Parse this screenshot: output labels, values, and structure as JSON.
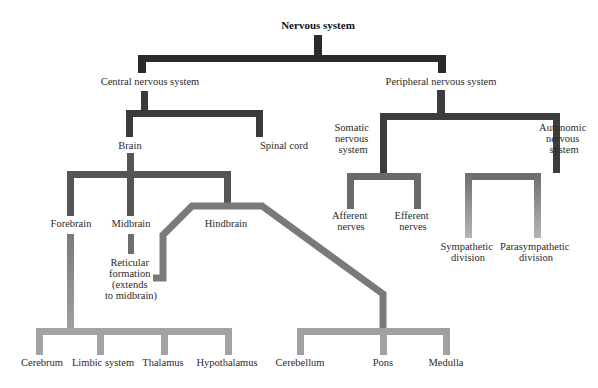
{
  "title": "Nervous system",
  "colors": {
    "level1": "#2b2b2b",
    "level2": "#3e3e3e",
    "level3": "#555555",
    "level4": "#6a6a6a",
    "level5": "#8a8a8a",
    "level6": "#a3a3a3",
    "background": "#ffffff"
  },
  "nodes": {
    "root": "Nervous system",
    "cns": "Central nervous system",
    "pns": "Peripheral nervous system",
    "brain": "Brain",
    "spinal_cord": "Spinal cord",
    "somatic": [
      "Somatic",
      "nervous",
      "system"
    ],
    "autonomic": [
      "Autonomic",
      "nervous",
      "system"
    ],
    "forebrain": "Forebrain",
    "midbrain": "Midbrain",
    "hindbrain": "Hindbrain",
    "reticular": [
      "Reticular",
      "formation",
      "(extends",
      "to midbrain)"
    ],
    "afferent": [
      "Afferent",
      "nerves"
    ],
    "efferent": [
      "Efferent",
      "nerves"
    ],
    "sympathetic": [
      "Sympathetic",
      "division"
    ],
    "parasympathetic": [
      "Parasympathetic",
      "division"
    ],
    "cerebrum": "Cerebrum",
    "limbic": "Limbic system",
    "thalamus": "Thalamus",
    "hypothalamus": "Hypothalamus",
    "cerebellum": "Cerebellum",
    "pons": "Pons",
    "medulla": "Medulla"
  }
}
